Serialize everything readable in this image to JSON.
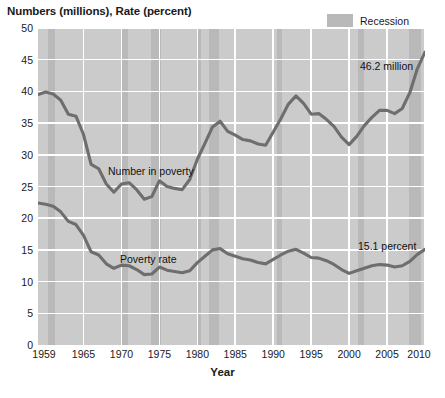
{
  "header": {
    "y_axis_title": "Numbers (millions), Rate (percent)",
    "x_axis_title": "Year"
  },
  "legend": {
    "position": "top-right",
    "entries": [
      {
        "label": "Recession",
        "color": "#b9b9b9"
      }
    ]
  },
  "annotations": {
    "number_series_label": "Number in poverty",
    "rate_series_label": "Poverty rate",
    "number_endpoint": "46.2 million",
    "rate_endpoint": "15.1 percent"
  },
  "colors": {
    "plot_background": "#cbcbcb",
    "gridline": "#ffffff",
    "recession_band": "#b9b9b9",
    "line": "#6e6e6e",
    "text": "#1a1a1a"
  },
  "chart_data": {
    "type": "line",
    "title": "",
    "xlabel": "Year",
    "ylabel": "Numbers (millions), Rate (percent)",
    "xlim": [
      1959,
      2010
    ],
    "ylim": [
      0,
      50
    ],
    "grid": true,
    "legend_position": "top-right",
    "ytick_labels": [
      "0",
      "5",
      "10",
      "15",
      "20",
      "25",
      "30",
      "35",
      "40",
      "45",
      "50"
    ],
    "yticks": [
      0,
      5,
      10,
      15,
      20,
      25,
      30,
      35,
      40,
      45,
      50
    ],
    "xtick_labels": [
      "1959",
      "1965",
      "1970",
      "1975",
      "1980",
      "1985",
      "1990",
      "1995",
      "2000",
      "2005",
      "2010"
    ],
    "xticks": [
      1959,
      1965,
      1970,
      1975,
      1980,
      1985,
      1990,
      1995,
      2000,
      2005,
      2010
    ],
    "x": [
      1959,
      1960,
      1961,
      1962,
      1963,
      1964,
      1965,
      1966,
      1967,
      1968,
      1969,
      1970,
      1971,
      1972,
      1973,
      1974,
      1975,
      1976,
      1977,
      1978,
      1979,
      1980,
      1981,
      1982,
      1983,
      1984,
      1985,
      1986,
      1987,
      1988,
      1989,
      1990,
      1991,
      1992,
      1993,
      1994,
      1995,
      1996,
      1997,
      1998,
      1999,
      2000,
      2001,
      2002,
      2003,
      2004,
      2005,
      2006,
      2007,
      2008,
      2009,
      2010
    ],
    "series": [
      {
        "name": "Number in poverty",
        "units": "millions",
        "values": [
          39.5,
          39.9,
          39.6,
          38.6,
          36.4,
          36.1,
          33.2,
          28.5,
          27.8,
          25.4,
          24.1,
          25.4,
          25.6,
          24.5,
          23.0,
          23.4,
          25.9,
          25.0,
          24.7,
          24.5,
          26.1,
          29.3,
          31.8,
          34.4,
          35.3,
          33.7,
          33.1,
          32.4,
          32.2,
          31.7,
          31.5,
          33.6,
          35.7,
          38.0,
          39.3,
          38.1,
          36.4,
          36.5,
          35.6,
          34.5,
          32.8,
          31.6,
          32.9,
          34.6,
          35.9,
          37.0,
          37.0,
          36.5,
          37.3,
          39.8,
          43.6,
          46.2
        ],
        "endpoint_label": "46.2 million"
      },
      {
        "name": "Poverty rate",
        "units": "percent",
        "values": [
          22.4,
          22.2,
          21.9,
          21.0,
          19.5,
          19.0,
          17.3,
          14.7,
          14.2,
          12.8,
          12.1,
          12.6,
          12.5,
          11.9,
          11.1,
          11.2,
          12.3,
          11.8,
          11.6,
          11.4,
          11.7,
          13.0,
          14.0,
          15.0,
          15.2,
          14.4,
          14.0,
          13.6,
          13.4,
          13.0,
          12.8,
          13.5,
          14.2,
          14.8,
          15.1,
          14.5,
          13.8,
          13.7,
          13.3,
          12.7,
          11.9,
          11.3,
          11.7,
          12.1,
          12.5,
          12.7,
          12.6,
          12.3,
          12.5,
          13.2,
          14.3,
          15.1
        ],
        "endpoint_label": "15.1 percent"
      }
    ],
    "recessions": [
      {
        "start": 1960.3,
        "end": 1961.2
      },
      {
        "start": 1969.9,
        "end": 1970.9
      },
      {
        "start": 1973.9,
        "end": 1975.2
      },
      {
        "start": 1980.0,
        "end": 1980.5
      },
      {
        "start": 1981.5,
        "end": 1982.9
      },
      {
        "start": 1990.5,
        "end": 1991.2
      },
      {
        "start": 2001.2,
        "end": 2001.9
      },
      {
        "start": 2007.9,
        "end": 2009.5
      }
    ]
  }
}
